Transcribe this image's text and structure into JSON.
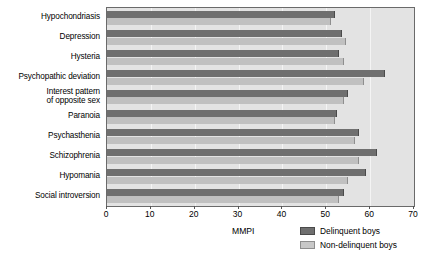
{
  "chart_data": {
    "type": "bar",
    "orientation": "horizontal",
    "title": "",
    "xlabel": "MMPI",
    "ylabel": "",
    "xlim": [
      0,
      70
    ],
    "xticks": [
      0,
      10,
      20,
      30,
      40,
      50,
      60,
      70
    ],
    "grid": true,
    "legend_position": "bottom-right",
    "categories": [
      "Hypochondriasis",
      "Depression",
      "Hysteria",
      "Psychopathic deviation",
      "Interest pattern\nof opposite sex",
      "Paranoia",
      "Psychasthenia",
      "Schizophrenia",
      "Hypomania",
      "Social introversion"
    ],
    "series": [
      {
        "name": "Delinquent boys",
        "color": "#6f6f6f",
        "values": [
          52.0,
          53.5,
          53.0,
          63.5,
          55.0,
          52.5,
          57.5,
          61.5,
          59.0,
          54.0
        ]
      },
      {
        "name": "Non-delinquent boys",
        "color": "#c0c0c0",
        "values": [
          51.0,
          54.5,
          54.0,
          58.5,
          54.0,
          52.0,
          56.5,
          57.5,
          55.0,
          53.0
        ]
      }
    ]
  },
  "axis": {
    "title": "MMPI",
    "tick_labels": [
      "0",
      "10",
      "20",
      "30",
      "40",
      "50",
      "60",
      "70"
    ]
  },
  "legend": {
    "items": [
      {
        "label": "Delinquent boys",
        "swatch": "dark"
      },
      {
        "label": "Non-delinquent boys",
        "swatch": "light"
      }
    ]
  }
}
